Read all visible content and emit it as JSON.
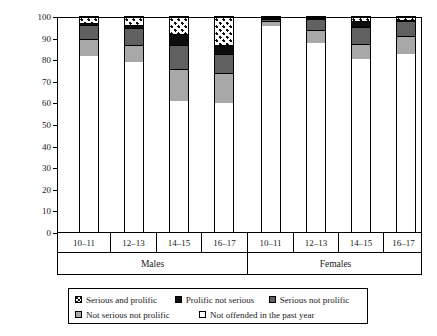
{
  "chart_data": {
    "type": "bar",
    "subtype": "stacked-100",
    "title": "",
    "xlabel": "",
    "ylabel": "Percentage",
    "ylim": [
      0,
      100
    ],
    "ytick_labels": [
      "0",
      "10",
      "20",
      "30",
      "40",
      "50",
      "60",
      "70",
      "80",
      "90",
      "100"
    ],
    "ytick_values": [
      0,
      10,
      20,
      30,
      40,
      50,
      60,
      70,
      80,
      90,
      100
    ],
    "grid": false,
    "legend_position": "bottom",
    "group_labels": [
      "Males",
      "Females"
    ],
    "categories": [
      "10–11",
      "12–13",
      "14–15",
      "16–17",
      "10–11",
      "12–13",
      "14–15",
      "16–17"
    ],
    "series": [
      {
        "name": "Not offended in the past year",
        "swatch": "white",
        "values": [
          82,
          79,
          61,
          60,
          96,
          88,
          80.5,
          83
        ]
      },
      {
        "name": "Not serious not prolific",
        "swatch": "medgray",
        "values": [
          8,
          8,
          15,
          14,
          2,
          6,
          7,
          8
        ]
      },
      {
        "name": "Serious not prolific",
        "swatch": "darkgray",
        "values": [
          6.5,
          8,
          11,
          9,
          1,
          5,
          8,
          7
        ]
      },
      {
        "name": "Prolific not serious",
        "swatch": "black",
        "values": [
          0.5,
          1.5,
          5,
          4,
          0.5,
          0.5,
          2.5,
          0.5
        ]
      },
      {
        "name": "Serious and prolific",
        "swatch": "checker",
        "values": [
          3,
          3.5,
          8,
          13,
          0.5,
          0.5,
          2,
          1.5
        ]
      }
    ]
  },
  "axis": {
    "ylabel": "Percentage"
  },
  "legend": {
    "row1": [
      {
        "label": "Serious and prolific",
        "swatch": "checker"
      },
      {
        "label": "Prolific not serious",
        "swatch": "black"
      },
      {
        "label": "Serious not prolific",
        "swatch": "darkgray"
      }
    ],
    "row2": [
      {
        "label": "Not serious not prolific",
        "swatch": "medgray"
      },
      {
        "label": "Not offended in the past year",
        "swatch": "white"
      }
    ]
  },
  "colors": {
    "white": "#ffffff",
    "medgray": "#a8a8a8",
    "darkgray": "#606060",
    "black": "#0d0d0d",
    "outline": "#000000"
  }
}
